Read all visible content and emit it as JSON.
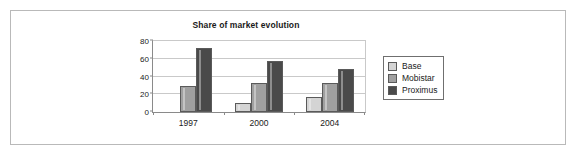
{
  "chart_data": {
    "type": "bar",
    "title": "Share of market evolution",
    "xlabel": "",
    "ylabel": "",
    "categories": [
      "1997",
      "2000",
      "2004"
    ],
    "series": [
      {
        "name": "Base",
        "color": "#d4d4d4",
        "values": [
          0,
          10,
          17
        ]
      },
      {
        "name": "Mobistar",
        "color": "#a0a0a0",
        "values": [
          29,
          33,
          33
        ]
      },
      {
        "name": "Proximus",
        "color": "#4a4a4a",
        "values": [
          72,
          58,
          49
        ]
      }
    ],
    "ylim": [
      0,
      80
    ],
    "yticks": [
      0,
      20,
      40,
      60,
      80
    ],
    "ytick_labels": [
      "0",
      "20",
      "40",
      "60",
      "80"
    ],
    "grid": true,
    "legend_position": "right",
    "legend_entries": [
      "Base",
      "Mobistar",
      "Proximus"
    ]
  },
  "frame": {
    "border_color": "#b9b9b9",
    "background": "#ffffff"
  }
}
